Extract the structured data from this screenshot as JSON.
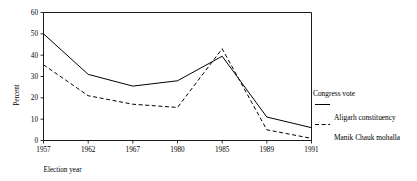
{
  "chart_data": {
    "type": "line",
    "title": "",
    "xlabel": "Election year",
    "ylabel": "Percent",
    "categories": [
      "1957",
      "1962",
      "1967",
      "1980",
      "1985",
      "1989",
      "1991"
    ],
    "ylim": [
      0,
      60
    ],
    "yticks": [
      "0",
      "10",
      "20",
      "30",
      "40",
      "50",
      "60"
    ],
    "grid": false,
    "legend_position": "right",
    "legend_title": "Congress vote",
    "series": [
      {
        "name": "Aligarh constituency",
        "style": "solid",
        "values": [
          50,
          31,
          25.5,
          28,
          39.5,
          11,
          6
        ]
      },
      {
        "name": "Manik Chauk mohalla",
        "style": "dashed",
        "values": [
          35.5,
          21,
          17,
          15.5,
          43,
          5,
          1
        ]
      }
    ]
  },
  "axis": {
    "y_ticks": [
      "60",
      "50",
      "40",
      "30",
      "20",
      "10",
      "0"
    ],
    "x_ticks": [
      "1957",
      "1962",
      "1967",
      "1980",
      "1985",
      "1989",
      "1991"
    ],
    "y_title": "Percent",
    "x_title": "Election year"
  },
  "legend": {
    "header": "Congress vote",
    "entries": [
      {
        "label": "Aligarh constituency",
        "style": "solid"
      },
      {
        "label": "Manik Chauk mohalla",
        "style": "dashed"
      }
    ]
  }
}
